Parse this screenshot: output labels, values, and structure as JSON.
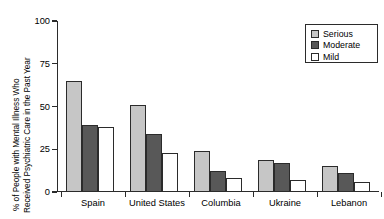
{
  "chart_data": {
    "type": "bar",
    "title": "",
    "xlabel": "",
    "ylabel": "% of People with Mental Illness Who Received Psychiatric Care in the Past Year",
    "ylabel_line1": "% of People with Mental Illness Who",
    "ylabel_line2": "Received Psychiatric Care in the Past Year",
    "ylim": [
      0,
      100
    ],
    "yticks": [
      0,
      25,
      50,
      75,
      100
    ],
    "ytick_labels": [
      "0",
      "25",
      "50",
      "75",
      "100"
    ],
    "grid": false,
    "legend_position": "top-right",
    "categories": [
      "Spain",
      "United States",
      "Columbia",
      "Ukraine",
      "Lebanon"
    ],
    "series": [
      {
        "name": "Serious",
        "color": "#c6c6c6",
        "values": [
          65,
          51,
          24,
          19,
          15
        ]
      },
      {
        "name": "Moderate",
        "color": "#585858",
        "values": [
          39,
          34,
          12,
          17,
          11
        ]
      },
      {
        "name": "Mild",
        "color": "#ffffff",
        "values": [
          38,
          23,
          8,
          7,
          6
        ]
      }
    ]
  },
  "legend": {
    "items": [
      {
        "label": "Serious",
        "swatch": "serious"
      },
      {
        "label": "Moderate",
        "swatch": "moderate"
      },
      {
        "label": "Mild",
        "swatch": "mild"
      }
    ]
  },
  "colors": {
    "serious": "#c6c6c6",
    "moderate": "#585858",
    "mild": "#ffffff",
    "axis": "#2b2b2b",
    "background": "#ffffff"
  }
}
